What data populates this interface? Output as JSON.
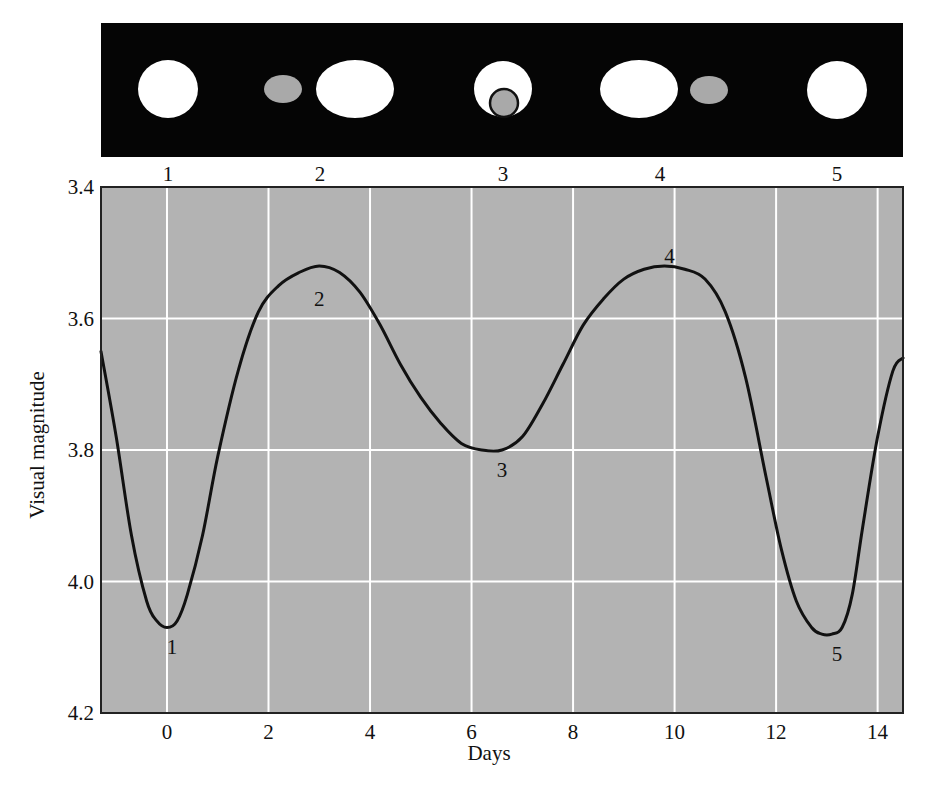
{
  "figure": {
    "colors": {
      "strip_background": "#050505",
      "star_bright": "#ffffff",
      "star_dim": "#a9a9a9",
      "plot_background": "#b3b3b3",
      "grid": "#ffffff",
      "curve": "#111111",
      "frame": "#222222"
    },
    "phase_strip": {
      "phases": [
        {
          "label": "1",
          "x": 168,
          "description": "dim star in front of bright star (primary eclipse)",
          "bodies": [
            {
              "type": "bright",
              "cx": 168,
              "cy": 89,
              "rx": 30,
              "ry": 29
            }
          ]
        },
        {
          "label": "2",
          "x": 320,
          "description": "stars side by side, dim star left",
          "bodies": [
            {
              "type": "dim",
              "cx": 283,
              "cy": 89,
              "rx": 19,
              "ry": 14
            },
            {
              "type": "bright",
              "cx": 355,
              "cy": 89,
              "rx": 39,
              "ry": 29
            }
          ]
        },
        {
          "label": "3",
          "x": 503,
          "description": "dim star in front of bright star (secondary eclipse)",
          "bodies": [
            {
              "type": "bright",
              "cx": 503,
              "cy": 89,
              "rx": 29,
              "ry": 28
            },
            {
              "type": "dim-outlined",
              "cx": 504,
              "cy": 103,
              "rx": 14,
              "ry": 14
            }
          ]
        },
        {
          "label": "4",
          "x": 660,
          "description": "stars side by side, dim star right",
          "bodies": [
            {
              "type": "bright",
              "cx": 639,
              "cy": 89,
              "rx": 39,
              "ry": 29
            },
            {
              "type": "dim",
              "cx": 709,
              "cy": 90,
              "rx": 19,
              "ry": 14
            }
          ]
        },
        {
          "label": "5",
          "x": 837,
          "description": "same as phase 1",
          "bodies": [
            {
              "type": "bright",
              "cx": 837,
              "cy": 90,
              "rx": 30,
              "ry": 29
            }
          ]
        }
      ]
    }
  },
  "chart_data": {
    "type": "line",
    "title": "",
    "xlabel": "Days",
    "ylabel": "Visual magnitude",
    "xlim": [
      -1.3,
      14.5
    ],
    "ylim": [
      4.2,
      3.4
    ],
    "y_inverted": true,
    "grid": true,
    "legend": null,
    "x_ticks": [
      "0",
      "2",
      "4",
      "6",
      "8",
      "10",
      "12",
      "14"
    ],
    "y_ticks": [
      "3.4",
      "3.6",
      "3.8",
      "4.0",
      "4.2"
    ],
    "series": [
      {
        "name": "Light curve",
        "x": [
          -1.3,
          -1.0,
          -0.7,
          -0.4,
          -0.2,
          0.0,
          0.2,
          0.4,
          0.7,
          1.0,
          1.4,
          1.8,
          2.2,
          2.6,
          3.0,
          3.4,
          3.8,
          4.2,
          4.6,
          5.0,
          5.4,
          5.8,
          6.2,
          6.6,
          7.0,
          7.4,
          7.8,
          8.2,
          8.6,
          9.0,
          9.4,
          9.8,
          10.2,
          10.6,
          11.0,
          11.4,
          11.8,
          12.1,
          12.4,
          12.7,
          12.9,
          13.1,
          13.3,
          13.5,
          13.7,
          14.0,
          14.3,
          14.5
        ],
        "y": [
          3.65,
          3.78,
          3.93,
          4.03,
          4.06,
          4.07,
          4.06,
          4.02,
          3.93,
          3.81,
          3.68,
          3.59,
          3.55,
          3.53,
          3.52,
          3.53,
          3.56,
          3.61,
          3.67,
          3.72,
          3.76,
          3.79,
          3.8,
          3.8,
          3.78,
          3.73,
          3.67,
          3.61,
          3.57,
          3.54,
          3.525,
          3.52,
          3.525,
          3.54,
          3.59,
          3.69,
          3.84,
          3.95,
          4.03,
          4.07,
          4.08,
          4.08,
          4.07,
          4.02,
          3.92,
          3.78,
          3.68,
          3.66
        ]
      }
    ],
    "annotations": [
      {
        "text": "1",
        "x": 0.1,
        "y": 4.1,
        "phase": 1
      },
      {
        "text": "2",
        "x": 3.0,
        "y": 3.57,
        "phase": 2
      },
      {
        "text": "3",
        "x": 6.6,
        "y": 3.83,
        "phase": 3
      },
      {
        "text": "4",
        "x": 9.9,
        "y": 3.505,
        "phase": 4
      },
      {
        "text": "5",
        "x": 13.2,
        "y": 4.11,
        "phase": 5
      }
    ],
    "phase_labels_top": [
      "1",
      "2",
      "3",
      "4",
      "5"
    ]
  }
}
